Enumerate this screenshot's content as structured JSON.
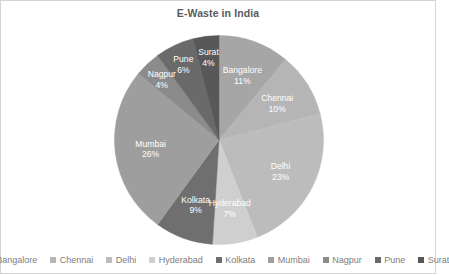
{
  "chart": {
    "title": "E-Waste in India"
  },
  "chart_data": {
    "type": "pie",
    "title": "E-Waste in India",
    "xlabel": "",
    "ylabel": "",
    "legend_position": "bottom",
    "grid": false,
    "value_unit": "%",
    "start_angle_deg": 0,
    "direction": "clockwise",
    "categories": [
      "Bangalore",
      "Chennai",
      "Delhi",
      "Hyderabad",
      "Kolkata",
      "Mumbai",
      "Nagpur",
      "Pune",
      "Surat"
    ],
    "values": [
      11,
      10,
      23,
      7,
      9,
      26,
      4,
      6,
      4
    ],
    "colors": [
      "#a6a6a6",
      "#b5b5b5",
      "#bcbcbc",
      "#cfcfcf",
      "#6f6f6f",
      "#9e9e9e",
      "#8b8b8b",
      "#6a6a6a",
      "#585858"
    ],
    "slices": [
      {
        "label": "Bangalore",
        "pct": "11%",
        "value": 11,
        "color": "#a6a6a6"
      },
      {
        "label": "Chennai",
        "pct": "10%",
        "value": 10,
        "color": "#b5b5b5"
      },
      {
        "label": "Delhi",
        "pct": "23%",
        "value": 23,
        "color": "#bcbcbc"
      },
      {
        "label": "Hyderabad",
        "pct": "7%",
        "value": 7,
        "color": "#cfcfcf"
      },
      {
        "label": "Kolkata",
        "pct": "9%",
        "value": 9,
        "color": "#6f6f6f"
      },
      {
        "label": "Mumbai",
        "pct": "26%",
        "value": 26,
        "color": "#9e9e9e"
      },
      {
        "label": "Nagpur",
        "pct": "4%",
        "value": 4,
        "color": "#8b8b8b"
      },
      {
        "label": "Pune",
        "pct": "6%",
        "value": 6,
        "color": "#6a6a6a"
      },
      {
        "label": "Surat",
        "pct": "4%",
        "value": 4,
        "color": "#585858"
      }
    ]
  },
  "legend": {
    "items": [
      {
        "label": "Bangalore",
        "color": "#a6a6a6"
      },
      {
        "label": "Chennai",
        "color": "#b5b5b5"
      },
      {
        "label": "Delhi",
        "color": "#bcbcbc"
      },
      {
        "label": "Hyderabad",
        "color": "#cfcfcf"
      },
      {
        "label": "Kolkata",
        "color": "#6f6f6f"
      },
      {
        "label": "Mumbai",
        "color": "#9e9e9e"
      },
      {
        "label": "Nagpur",
        "color": "#8b8b8b"
      },
      {
        "label": "Pune",
        "color": "#6a6a6a"
      },
      {
        "label": "Surat",
        "color": "#585858"
      }
    ]
  }
}
